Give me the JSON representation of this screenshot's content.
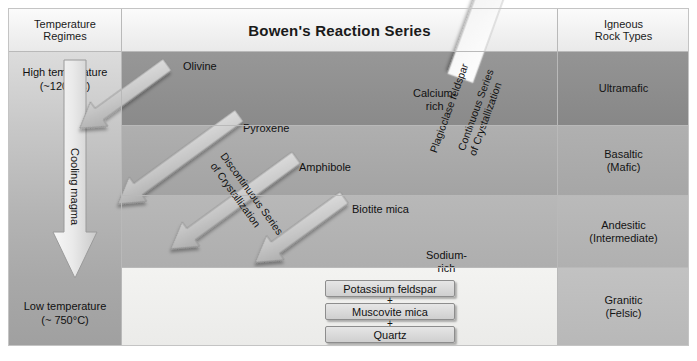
{
  "title": "Bowen's Reaction Series",
  "columns": {
    "left_header": "Temperature\nRegimes",
    "center_header": "Bowen's Reaction Series",
    "right_header": "Igneous\nRock Types"
  },
  "temperature": {
    "high_label": "High temperature\n(~1200°C)",
    "low_label": "Low temperature\n(~ 750°C)",
    "arrow_label": "Cooling magma",
    "arrow_icon": "down-arrow-icon"
  },
  "rock_types": [
    {
      "name": "Ultramafic",
      "color": "#8e8e8e"
    },
    {
      "name": "Basaltic\n(Mafic)",
      "color": "#a9a9a9"
    },
    {
      "name": "Andesitic\n(Intermediate)",
      "color": "#b4b4b4"
    },
    {
      "name": "Granitic\n(Felsic)",
      "color": "#bcbcbc"
    }
  ],
  "discontinuous_series": {
    "label": "Discontinuous Series\nof Crystallization",
    "minerals": [
      {
        "name": "Olivine"
      },
      {
        "name": "Pyroxene"
      },
      {
        "name": "Amphibole"
      },
      {
        "name": "Biotite mica"
      }
    ]
  },
  "continuous_series": {
    "label": "Continuous Series\nof Crystallization",
    "mineral": "Plagioclase feldspar",
    "top_end": "Calcium-\nrich",
    "bottom_end": "Sodium-\nrich"
  },
  "final_products": [
    {
      "name": "Potassium feldspar"
    },
    {
      "name": "Muscovite mica"
    },
    {
      "name": "Quartz"
    }
  ],
  "plus_signs": [
    "+",
    "+"
  ],
  "band_colors": {
    "row1": "#8f8f8f",
    "row2": "#a8a8a8",
    "row3": "#b3b3b3",
    "row4": "#f0f0ee",
    "header": "#f2f2f2"
  }
}
